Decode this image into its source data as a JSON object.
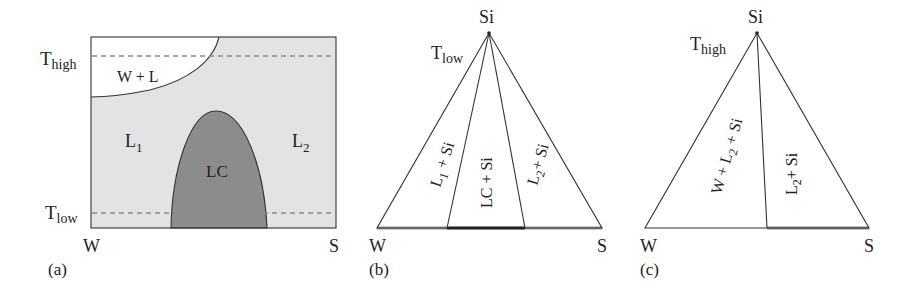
{
  "panel_a": {
    "caption": "(a)",
    "axis_left": "W",
    "axis_right": "S",
    "t_high": {
      "main": "T",
      "sub": "high"
    },
    "t_low": {
      "main": "T",
      "sub": "low"
    },
    "regions": {
      "w_plus_l": "W + L",
      "l1": {
        "main": "L",
        "sub": "1"
      },
      "l2": {
        "main": "L",
        "sub": "2"
      },
      "lc": "LC"
    },
    "colors": {
      "background": "#e3e3e3",
      "lc": "#8c8c8c",
      "w_plus_l": "#ffffff",
      "dashed": "#8a8a8a"
    }
  },
  "panel_b": {
    "caption": "(b)",
    "apex": "Si",
    "left": "W",
    "right": "S",
    "temperature": {
      "main": "T",
      "sub": "low"
    },
    "regions": {
      "l1_si": {
        "main": "L",
        "sub": "1",
        "rest": " + Si"
      },
      "lc_si": "LC + Si",
      "l2_si": {
        "main": "L",
        "sub": "2",
        "rest": "+ Si"
      }
    }
  },
  "panel_c": {
    "caption": "(c)",
    "apex": "Si",
    "left": "W",
    "right": "S",
    "temperature": {
      "main": "T",
      "sub": "high"
    },
    "regions": {
      "w_l2_si": {
        "pre": "W + L",
        "sub": "2",
        "rest": " + Si"
      },
      "l2_si": {
        "main": "L",
        "sub": "2",
        "rest": "+ Si"
      }
    }
  }
}
